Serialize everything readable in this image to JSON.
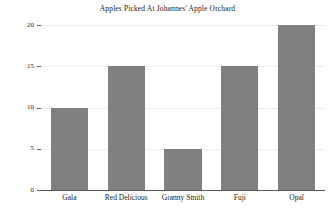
{
  "chart_data": {
    "type": "bar",
    "title": "Apples Picked At Johannes' Apple Orchard",
    "xlabel": "",
    "ylabel": "",
    "categories": [
      "Gala",
      "Red Delicious",
      "Granny Smith",
      "Fuji",
      "Opal"
    ],
    "values": [
      10,
      15,
      5,
      15,
      20
    ],
    "ylim": [
      0,
      20
    ],
    "yticks": [
      0,
      5,
      10,
      15,
      20
    ],
    "ytick_labels": [
      "0",
      "5",
      "10",
      "15",
      "20"
    ],
    "grid": true,
    "legend": false,
    "bar_color": "#808080",
    "grid_color": "#ededed",
    "axis_color": "#555555",
    "text_color": "#1a1a1a",
    "background": "#ffffff"
  }
}
